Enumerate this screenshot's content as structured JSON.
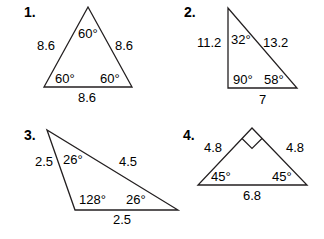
{
  "problems": [
    {
      "number": "1.",
      "sides": {
        "left": "8.6",
        "right": "8.6",
        "bottom": "8.6"
      },
      "angles": {
        "top": "60°",
        "bottom_left": "60°",
        "bottom_right": "60°"
      }
    },
    {
      "number": "2.",
      "sides": {
        "left": "11.2",
        "hypotenuse": "13.2",
        "bottom": "7"
      },
      "angles": {
        "top": "32°",
        "bottom_left": "90°",
        "bottom_right": "58°"
      }
    },
    {
      "number": "3.",
      "sides": {
        "left": "2.5",
        "top": "4.5",
        "bottom": "2.5"
      },
      "angles": {
        "top_left": "26°",
        "bottom_left": "128°",
        "right": "26°"
      }
    },
    {
      "number": "4.",
      "sides": {
        "left": "4.8",
        "right": "4.8",
        "bottom": "6.8"
      },
      "angles": {
        "bottom_left": "45°",
        "bottom_right": "45°",
        "top": "right-angle-marker"
      }
    }
  ]
}
